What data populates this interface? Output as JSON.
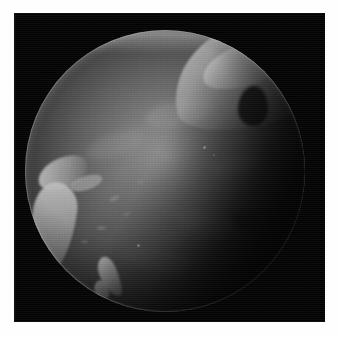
{
  "document": {
    "kind": "satellite-image",
    "title": "",
    "caption": "",
    "background_color": "#ffffff",
    "plate_color": "#020202"
  },
  "image": {
    "subject": "earth-globe",
    "view": "pacific-hemisphere",
    "rendering": "grayscale",
    "alt_text": "Grayscale satellite view of Earth centered on the Pacific Ocean, with a bright subsolar highlight left of center and the night terminator darkening the right limb.",
    "plate": {
      "x": 14,
      "y": 13,
      "width": 311,
      "height": 309
    },
    "globe": {
      "center_x": 151,
      "center_y": 158,
      "radius_x": 140,
      "radius_y": 141,
      "subsolar_point_x": 155,
      "subsolar_point_y": 145,
      "limb_color": "#f0f0f0",
      "ocean_color": "#5a5a5a",
      "shadow_color": "#070707"
    },
    "features": [
      {
        "name": "north-america",
        "label": "North America / Alaska arc",
        "brightness": "bright",
        "position": "upper-right-limb"
      },
      {
        "name": "polar-band",
        "label": "Northern cloud band",
        "brightness": "bright",
        "position": "top-limb"
      },
      {
        "name": "australia",
        "label": "Australia",
        "brightness": "bright",
        "position": "left-limb-lower"
      },
      {
        "name": "indonesia",
        "label": "Indonesia archipelago",
        "brightness": "bright",
        "position": "left-middle"
      },
      {
        "name": "new-guinea",
        "label": "New Guinea",
        "brightness": "medium",
        "position": "left-middle"
      },
      {
        "name": "new-zealand",
        "label": "New Zealand",
        "brightness": "bright",
        "position": "lower-left"
      },
      {
        "name": "pacific-ocean",
        "label": "Pacific Ocean",
        "brightness": "medium",
        "position": "center"
      },
      {
        "name": "terminator",
        "label": "Night terminator",
        "brightness": "dark",
        "position": "right-and-lower-right"
      }
    ]
  }
}
